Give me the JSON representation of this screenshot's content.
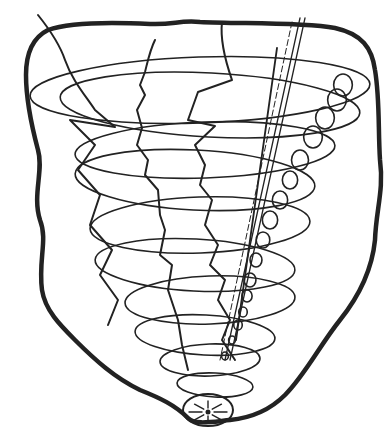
{
  "image": {
    "description": "Black ink line drawing of a tornado-like funnel of stacked spiral ellipses inside a rough hand-drawn border, with zigzag lightning lines, straight diagonal lines, a chain of small loops along the right side, and a small radiating circle at the bottom tip",
    "width": 392,
    "height": 436,
    "colors": {
      "background": "#ffffff",
      "ink": "#222222"
    }
  },
  "funnel_rings": [
    {
      "cx": 200,
      "cy": 90,
      "rx": 170,
      "ry": 33
    },
    {
      "cx": 210,
      "cy": 105,
      "rx": 150,
      "ry": 32
    },
    {
      "cx": 205,
      "cy": 150,
      "rx": 130,
      "ry": 28
    },
    {
      "cx": 195,
      "cy": 180,
      "rx": 120,
      "ry": 30
    },
    {
      "cx": 200,
      "cy": 225,
      "rx": 110,
      "ry": 28
    },
    {
      "cx": 195,
      "cy": 265,
      "rx": 100,
      "ry": 26
    },
    {
      "cx": 210,
      "cy": 300,
      "rx": 85,
      "ry": 24
    },
    {
      "cx": 205,
      "cy": 335,
      "rx": 70,
      "ry": 20
    },
    {
      "cx": 210,
      "cy": 360,
      "rx": 50,
      "ry": 16
    },
    {
      "cx": 215,
      "cy": 385,
      "rx": 38,
      "ry": 12
    }
  ],
  "loops": [
    {
      "cx": 343,
      "cy": 85,
      "r": 11
    },
    {
      "cx": 337,
      "cy": 100,
      "r": 11
    },
    {
      "cx": 325,
      "cy": 118,
      "r": 11
    },
    {
      "cx": 313,
      "cy": 137,
      "r": 11
    },
    {
      "cx": 300,
      "cy": 160,
      "r": 10
    },
    {
      "cx": 290,
      "cy": 180,
      "r": 9
    },
    {
      "cx": 280,
      "cy": 200,
      "r": 9
    },
    {
      "cx": 270,
      "cy": 220,
      "r": 9
    },
    {
      "cx": 263,
      "cy": 240,
      "r": 8
    },
    {
      "cx": 256,
      "cy": 260,
      "r": 7
    },
    {
      "cx": 250,
      "cy": 280,
      "r": 7
    },
    {
      "cx": 247,
      "cy": 296,
      "r": 6
    },
    {
      "cx": 243,
      "cy": 312,
      "r": 5
    },
    {
      "cx": 238,
      "cy": 325,
      "r": 5
    },
    {
      "cx": 232,
      "cy": 340,
      "r": 4
    },
    {
      "cx": 225,
      "cy": 356,
      "r": 4
    }
  ],
  "bottom_sun": {
    "cx": 208,
    "cy": 410,
    "rx": 25,
    "ry": 16,
    "rays": 8
  }
}
